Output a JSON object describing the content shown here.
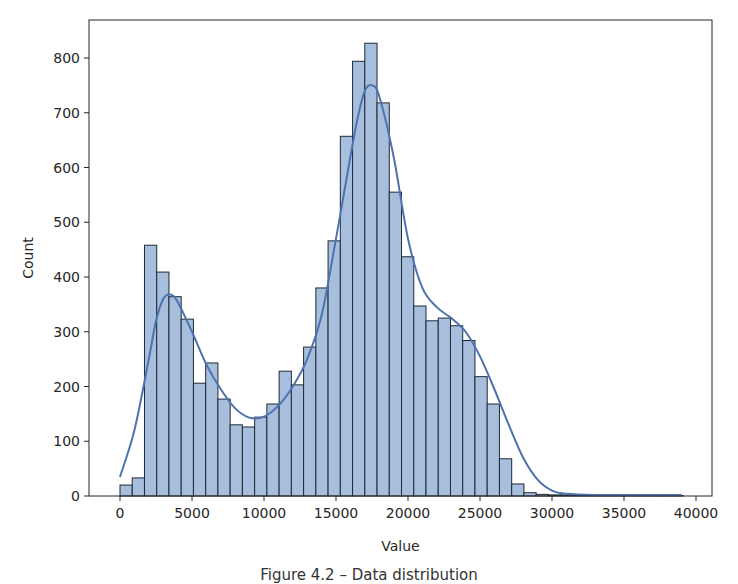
{
  "figure": {
    "caption": "Figure 4.2 – Data distribution"
  },
  "colors": {
    "bar_fill": "#a7bfdc",
    "bar_edge": "#1f2a36",
    "kde_line": "#4c72b0",
    "axis": "#262626"
  },
  "chart_data": {
    "type": "bar",
    "subtype": "histogram_with_kde",
    "title": "",
    "xlabel": "Value",
    "ylabel": "Count",
    "xlim": [
      -2200,
      41300
    ],
    "ylim": [
      0,
      870
    ],
    "grid": false,
    "legend": null,
    "x_ticks": [
      0,
      5000,
      10000,
      15000,
      20000,
      25000,
      30000,
      35000,
      40000
    ],
    "x_tick_labels": [
      "0",
      "5000",
      "10000",
      "15000",
      "20000",
      "25000",
      "30000",
      "35000",
      "40000"
    ],
    "y_ticks": [
      0,
      100,
      200,
      300,
      400,
      500,
      600,
      700,
      800
    ],
    "y_tick_labels": [
      "0",
      "100",
      "200",
      "300",
      "400",
      "500",
      "600",
      "700",
      "800"
    ],
    "bin_start": 0,
    "bin_width": 850,
    "bin_counts": [
      20,
      33,
      458,
      409,
      364,
      323,
      206,
      243,
      177,
      130,
      126,
      144,
      168,
      228,
      203,
      272,
      380,
      466,
      657,
      794,
      827,
      718,
      555,
      437,
      347,
      320,
      325,
      311,
      284,
      218,
      168,
      68,
      22,
      6,
      3,
      2,
      2,
      1,
      1,
      1,
      1,
      1,
      1,
      1,
      1,
      1
    ],
    "kde": {
      "x": [
        0,
        1000,
        2000,
        2500,
        3000,
        3500,
        4000,
        5000,
        6000,
        7000,
        8000,
        9000,
        10000,
        11000,
        12000,
        13000,
        14000,
        15000,
        16000,
        16500,
        17000,
        17500,
        18000,
        19000,
        20000,
        21000,
        22000,
        23000,
        24000,
        25000,
        26000,
        27000,
        28000,
        29000,
        30000,
        31000,
        33000,
        36000,
        39000
      ],
      "y": [
        35,
        120,
        250,
        320,
        360,
        368,
        355,
        300,
        240,
        195,
        160,
        143,
        145,
        165,
        200,
        250,
        330,
        470,
        620,
        690,
        740,
        750,
        730,
        620,
        470,
        380,
        345,
        325,
        300,
        255,
        195,
        130,
        70,
        30,
        10,
        4,
        2,
        2,
        2
      ]
    }
  }
}
